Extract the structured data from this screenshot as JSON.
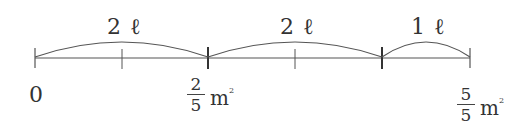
{
  "diagram": {
    "type": "number-line",
    "segments": [
      {
        "label_num": "2",
        "label_unit": "ℓ",
        "from_tick": 0,
        "to_tick": 2
      },
      {
        "label_num": "2",
        "label_unit": "ℓ",
        "from_tick": 2,
        "to_tick": 4
      },
      {
        "label_num": "1",
        "label_unit": "ℓ",
        "from_tick": 4,
        "to_tick": 5
      }
    ],
    "labels": {
      "zero": "0",
      "mid": {
        "numerator": "2",
        "denominator": "5",
        "unit": "m",
        "unit_sup": "2"
      },
      "end": {
        "numerator": "5",
        "denominator": "5",
        "unit": "m",
        "unit_sup": "2"
      }
    },
    "colors": {
      "line": "#444444",
      "text": "#333333"
    }
  }
}
